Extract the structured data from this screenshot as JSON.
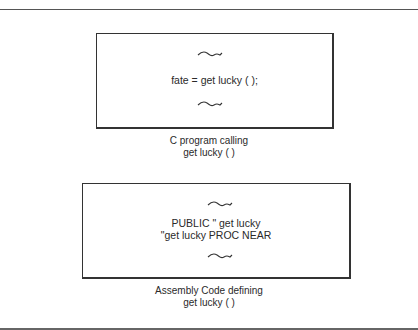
{
  "figure": {
    "c_block": {
      "code_line": "fate = get lucky ( );",
      "caption_lines": [
        "C program calling",
        "get lucky ( )"
      ]
    },
    "asm_block": {
      "code_lines": [
        "PUBLIC \" get lucky",
        "\"get lucky PROC NEAR"
      ],
      "caption_lines": [
        "Assembly Code defining",
        "get lucky ( )"
      ]
    },
    "icons": {
      "ellipsis_squiggle": "wavy-line-omitted-code"
    },
    "colors": {
      "stroke": "#333333",
      "text": "#2a2a2a",
      "background": "#ffffff"
    }
  }
}
